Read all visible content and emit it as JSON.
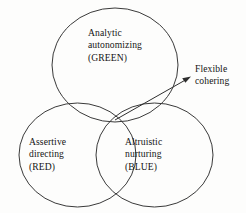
{
  "diagram": {
    "type": "venn-three-circle",
    "background_color": "#fdfdfc",
    "stroke_color": "#3a3a3a",
    "text_color": "#151515",
    "circles": [
      {
        "id": "analytic",
        "position": "top",
        "cx": 115,
        "cy": 65,
        "rx": 63,
        "ry": 57,
        "line1": "Analytic",
        "line2": "autonomizing",
        "line3": "(GREEN)",
        "color_name": "GREEN"
      },
      {
        "id": "assertive",
        "position": "bottom-left",
        "cx": 77.5,
        "cy": 155,
        "rx": 58.5,
        "ry": 52,
        "line1": "Assertive",
        "line2": "directing",
        "line3": "(RED)",
        "color_name": "RED"
      },
      {
        "id": "altruistic",
        "position": "bottom-right",
        "cx": 154.5,
        "cy": 155,
        "rx": 58.5,
        "ry": 52,
        "line1": "Altruistic",
        "line2": "nurturing",
        "line3": "(BLUE)",
        "color_name": "BLUE"
      }
    ],
    "annotation": {
      "id": "flexible-cohering",
      "line1": "Flexible",
      "line2": "cohering",
      "points_to": "central-triple-intersection",
      "arrow_tail": [
        115,
        120
      ],
      "arrow_head": [
        190,
        77
      ]
    }
  }
}
